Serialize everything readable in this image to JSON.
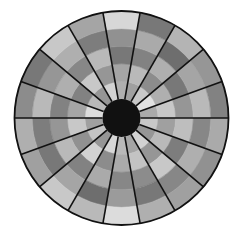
{
  "caption": "",
  "chart_data": {
    "type": "heatmap",
    "subtype": "polar",
    "title": "",
    "center": [
      121.5,
      118
    ],
    "outer_radius": 107,
    "inner_radius": 19,
    "sector_count": 18,
    "sector_angle_deg": 20,
    "ring_count": 5,
    "ring_radii": [
      19,
      36.6,
      54.2,
      71.8,
      89.4,
      107
    ],
    "hub_color": "#111111",
    "divider_color": "#111111",
    "colormap": "grayscale",
    "sectors_start_deg": [
      0,
      20,
      40,
      60,
      80,
      100,
      120,
      140,
      160,
      180,
      200,
      220,
      240,
      260,
      280,
      300,
      320,
      340
    ],
    "values_note": "cell gray levels per sector (counter-clockwise from 0deg=east), ring order inner->outer; 0=black,255=white",
    "cells": [
      [
        170,
        200,
        150,
        185,
        130
      ],
      [
        225,
        175,
        120,
        165,
        150
      ],
      [
        200,
        140,
        175,
        110,
        180
      ],
      [
        160,
        185,
        130,
        170,
        120
      ],
      [
        175,
        165,
        120,
        145,
        215
      ],
      [
        210,
        150,
        185,
        125,
        165
      ],
      [
        150,
        200,
        135,
        175,
        200
      ],
      [
        185,
        130,
        175,
        150,
        120
      ],
      [
        220,
        165,
        130,
        185,
        140
      ],
      [
        160,
        200,
        150,
        125,
        175
      ],
      [
        195,
        145,
        185,
        120,
        160
      ],
      [
        150,
        210,
        130,
        165,
        200
      ],
      [
        215,
        140,
        170,
        110,
        185
      ],
      [
        185,
        170,
        135,
        155,
        220
      ],
      [
        165,
        195,
        140,
        120,
        175
      ],
      [
        210,
        150,
        200,
        135,
        160
      ],
      [
        150,
        185,
        125,
        175,
        145
      ],
      [
        200,
        160,
        190,
        135,
        170
      ]
    ]
  }
}
